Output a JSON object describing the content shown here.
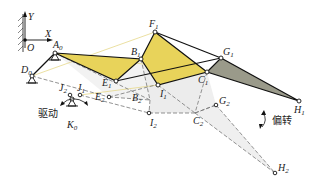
{
  "axes": {
    "x_label": "X",
    "y_label": "Y",
    "origin_label": "O"
  },
  "annotations": {
    "drive": "驱动",
    "deflect": "偏转"
  },
  "colors": {
    "yellow_link": "#e8d35a",
    "gray_link": "#9a9a8a",
    "ghost_fill": "#ececec",
    "line": "#111111",
    "dashed": "#777777",
    "thin_yellow": "#e6d88a"
  },
  "points": {
    "A0": {
      "label": "A",
      "sub": "0"
    },
    "D0": {
      "label": "D",
      "sub": "0"
    },
    "K0": {
      "label": "K",
      "sub": "0"
    },
    "F1": {
      "label": "F",
      "sub": "1"
    },
    "B1": {
      "label": "B",
      "sub": "1"
    },
    "E1": {
      "label": "E",
      "sub": "1"
    },
    "I1": {
      "label": "I",
      "sub": "1"
    },
    "C1": {
      "label": "C",
      "sub": "1"
    },
    "G1": {
      "label": "G",
      "sub": "1"
    },
    "H1": {
      "label": "H",
      "sub": "1"
    },
    "J1": {
      "label": "J",
      "sub": "1"
    },
    "J2": {
      "label": "J",
      "sub": "2"
    },
    "E2": {
      "label": "E",
      "sub": "2"
    },
    "B2": {
      "label": "B",
      "sub": "2"
    },
    "I2": {
      "label": "I",
      "sub": "2"
    },
    "C2": {
      "label": "C",
      "sub": "2"
    },
    "G2": {
      "label": "G",
      "sub": "2"
    },
    "H2": {
      "label": "H",
      "sub": "2"
    }
  }
}
